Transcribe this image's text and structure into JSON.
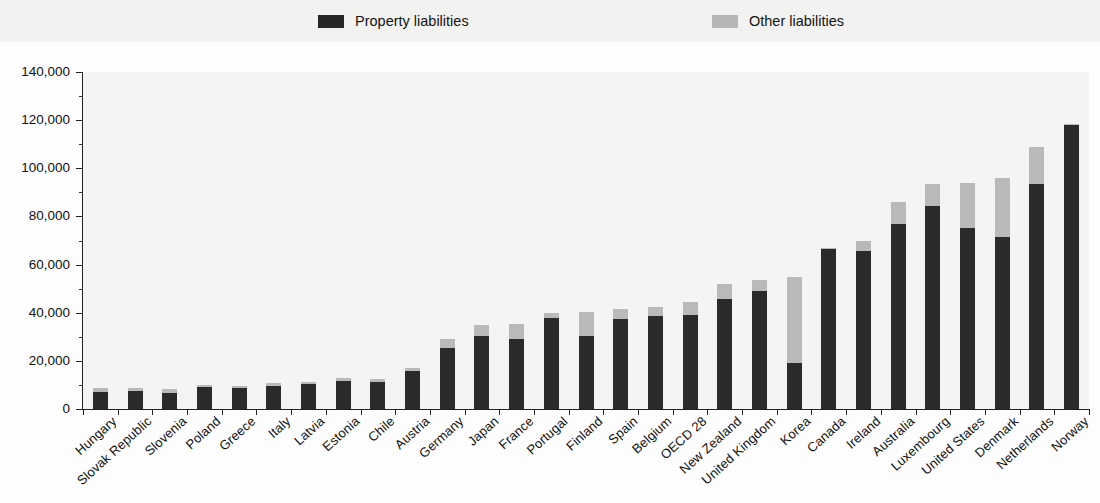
{
  "legend": {
    "items": [
      {
        "label": "Property liabilities",
        "color": "#2a2a2a",
        "key": "property"
      },
      {
        "label": "Other liabilities",
        "color": "#b9b9b9",
        "key": "other"
      }
    ]
  },
  "axes": {
    "y_ticks": [
      "0",
      "20,000",
      "40,000",
      "60,000",
      "80,000",
      "100,000",
      "120,000",
      "140,000"
    ],
    "y_min": 0,
    "y_max": 140000,
    "y_step": 20000,
    "y_minor_step": 10000,
    "x_label": "",
    "y_label": ""
  },
  "chart_data": {
    "type": "bar",
    "subtype": "stacked-vertical",
    "title": "",
    "xlabel": "",
    "ylabel": "",
    "ylim": [
      0,
      140000
    ],
    "ytick_step": 20000,
    "grid": false,
    "legend_position": "top",
    "categories": [
      "Hungary",
      "Slovak Republic",
      "Slovenia",
      "Poland",
      "Greece",
      "Italy",
      "Latvia",
      "Estonia",
      "Chile",
      "Austria",
      "Germany",
      "Japan",
      "France",
      "Portugal",
      "Finland",
      "Spain",
      "Belgium",
      "OECD 28",
      "New Zealand",
      "United Kingdom",
      "Korea",
      "Canada",
      "Ireland",
      "Australia",
      "Luxembourg",
      "United States",
      "Denmark",
      "Netherlands",
      "Norway"
    ],
    "series": [
      {
        "name": "Property liabilities",
        "color": "#2a2a2a",
        "values": [
          7200,
          7300,
          6800,
          9200,
          8700,
          9500,
          10200,
          11800,
          11200,
          16000,
          25500,
          30500,
          29000,
          38000,
          30500,
          37500,
          38500,
          39000,
          45500,
          49000,
          19000,
          66500,
          65500,
          77000,
          84500,
          75000,
          71500,
          93500,
          118000
        ]
      },
      {
        "name": "Other liabilities",
        "color": "#b9b9b9",
        "values": [
          1500,
          1300,
          1600,
          900,
          900,
          1200,
          900,
          900,
          1100,
          1200,
          3500,
          4500,
          6500,
          2000,
          10000,
          4000,
          4000,
          5500,
          6500,
          4500,
          36000,
          300,
          4500,
          9000,
          9000,
          19000,
          24500,
          15500,
          300
        ]
      }
    ],
    "totals": [
      8700,
      8600,
      8400,
      10100,
      9600,
      10700,
      11100,
      12700,
      12300,
      17200,
      29000,
      35000,
      35500,
      40000,
      40500,
      41500,
      42500,
      44500,
      52000,
      53500,
      55000,
      66800,
      70000,
      86000,
      93500,
      94000,
      96000,
      109000,
      118300
    ]
  }
}
